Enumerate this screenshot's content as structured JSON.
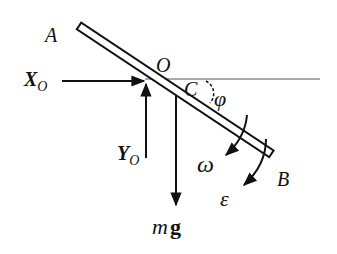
{
  "diagram": {
    "labels": {
      "A": "A",
      "B": "B",
      "O": "O",
      "C": "C",
      "phi": "φ",
      "omega": "ω",
      "epsilon": "ε",
      "Xo_main": "X",
      "Xo_sub": "O",
      "Yo_main": "Y",
      "Yo_sub": "O",
      "mg_m": "m",
      "mg_g": "g"
    },
    "colors": {
      "stroke": "#111111",
      "background": "#ffffff",
      "reference_line": "#555555"
    }
  }
}
